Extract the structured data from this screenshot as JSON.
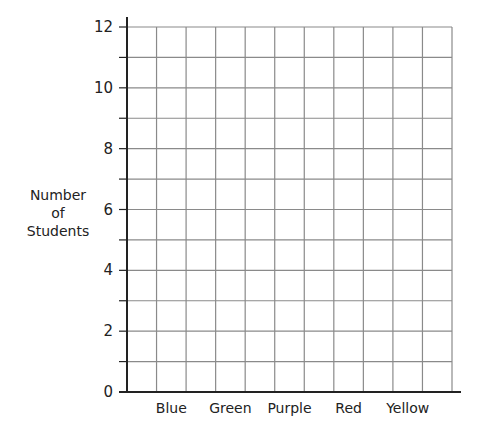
{
  "chart_data": {
    "type": "bar",
    "title": "",
    "xlabel": "",
    "ylabel": "Number of Students",
    "ylabel_lines": [
      "Number",
      "of",
      "Students"
    ],
    "categories": [
      "Blue",
      "Green",
      "Purple",
      "Red",
      "Yellow"
    ],
    "values": [
      null,
      null,
      null,
      null,
      null
    ],
    "ylim": [
      0,
      12
    ],
    "yticks": [
      0,
      2,
      4,
      6,
      8,
      10,
      12
    ],
    "minor_step": 1,
    "grid": true,
    "grid_columns": 11,
    "legend": "none",
    "colors": {
      "axis": "#222222",
      "grid": "#8a8a8a"
    }
  }
}
